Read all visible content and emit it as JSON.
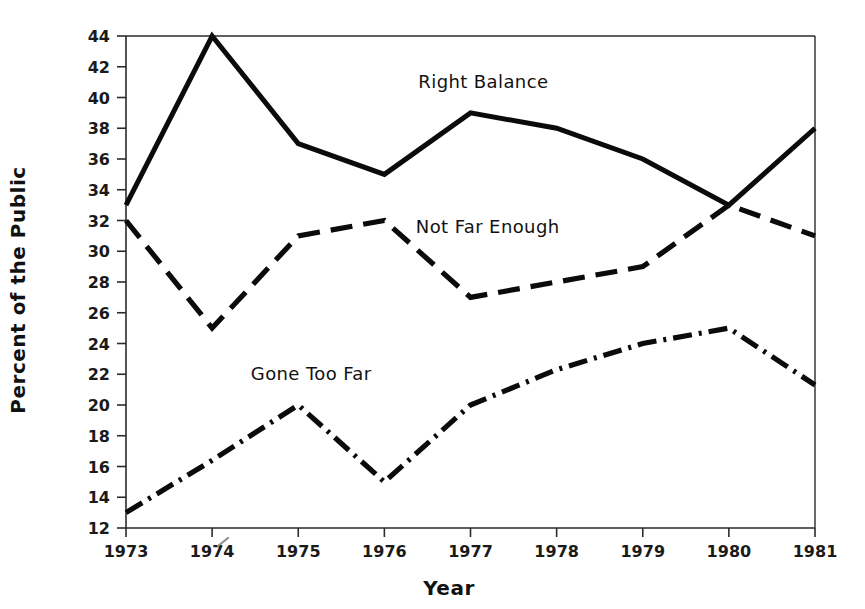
{
  "chart_data": {
    "type": "line",
    "title": "",
    "xlabel": "Year",
    "ylabel": "Percent of the Public",
    "x": [
      1973,
      1974,
      1975,
      1976,
      1977,
      1978,
      1979,
      1980,
      1981
    ],
    "xtick_labels": [
      "1973",
      "1974",
      "1975",
      "1976",
      "1977",
      "1978",
      "1979",
      "1980",
      "1981"
    ],
    "xlim": [
      1973,
      1981
    ],
    "ylim": [
      12,
      44
    ],
    "ytick_labels": [
      "12",
      "14",
      "16",
      "18",
      "20",
      "22",
      "24",
      "26",
      "28",
      "30",
      "32",
      "34",
      "36",
      "38",
      "40",
      "42",
      "44"
    ],
    "ytick_values": [
      12,
      14,
      16,
      18,
      20,
      22,
      24,
      26,
      28,
      30,
      32,
      34,
      36,
      38,
      40,
      42,
      44
    ],
    "grid": false,
    "legend_position": "inline-annotations",
    "series": [
      {
        "name": "Right Balance",
        "style": "solid",
        "color": "#0b0b0b",
        "values": [
          33,
          44,
          37,
          35,
          39,
          38,
          36,
          33,
          38
        ],
        "label_x": 1977.15,
        "label_y": 40.6
      },
      {
        "name": "Not Far Enough",
        "style": "dashed",
        "color": "#0b0b0b",
        "values": [
          32,
          25,
          31,
          32,
          27,
          28,
          29,
          33,
          31
        ],
        "label_x": 1977.2,
        "label_y": 31.2
      },
      {
        "name": "Gone Too Far",
        "style": "dash-dot",
        "color": "#0b0b0b",
        "values": [
          13,
          16.4,
          20,
          15,
          20,
          22.3,
          24,
          25,
          21.3
        ],
        "label_x": 1975.15,
        "label_y": 21.6
      }
    ]
  },
  "axes": {
    "x_title": "Year",
    "y_title": "Percent of the Public"
  }
}
